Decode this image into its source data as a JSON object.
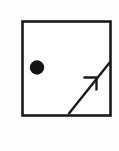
{
  "figure": {
    "canvas": {
      "width": 119,
      "height": 151,
      "background_color": "#fdfdfd"
    },
    "ink_color": "#1a1a1a",
    "shapes": {
      "square": {
        "name": "square-border",
        "x": 22.5,
        "y": 21.5,
        "width": 88,
        "height": 94,
        "stroke_width": 2.6,
        "fill": "#ffffff",
        "stroke": "#1a1a1a"
      },
      "dot": {
        "name": "filled-circle-marker",
        "cx": 37,
        "cy": 67.5,
        "r": 7.2,
        "fill": "#141414"
      },
      "arrow": {
        "name": "diagonal-arrow",
        "x1": 68.5,
        "y1": 114,
        "x2": 110.5,
        "y2": 61.5,
        "stroke_width": 2.4,
        "stroke": "#1a1a1a",
        "head": {
          "tip_x": 96.5,
          "tip_y": 77.5,
          "barb_left_x": 83.5,
          "barb_left_y": 77.5,
          "barb_down_x": 96.5,
          "barb_down_y": 90.5,
          "stroke_width": 2.4
        }
      }
    }
  }
}
